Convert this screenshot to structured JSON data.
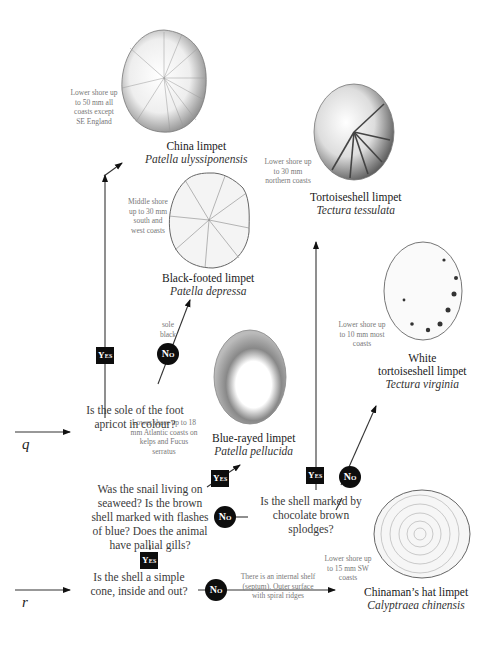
{
  "entry_points": {
    "q": "q",
    "r": "r"
  },
  "species": {
    "china": {
      "common": "China limpet",
      "latin": "Patella ulyssiponensis",
      "note": "Lower shore up to 50 mm all coasts except SE England"
    },
    "black_footed": {
      "common": "Black-footed limpet",
      "latin": "Patella depressa",
      "note": "Middle shore up to 30 mm south and west coasts"
    },
    "tortoiseshell": {
      "common": "Tortoiseshell limpet",
      "latin": "Tectura tessulata",
      "note": "Lower shore up to 30 mm northern coasts"
    },
    "white_tortoiseshell": {
      "common_line1": "White",
      "common_line2": "tortoiseshell limpet",
      "latin": "Tectura virginia",
      "note": "Lower shore up to 10 mm most coasts"
    },
    "blue_rayed": {
      "common": "Blue-rayed limpet",
      "latin": "Patella pellucida",
      "note": "Lower shore up to 18 mm Atlantic coasts on kelps and Fucus serratus"
    },
    "chinamans_hat": {
      "common": "Chinaman’s hat limpet",
      "latin": "Calyptraea chinensis",
      "note": "Lower shore up to 15 mm SW coasts"
    }
  },
  "questions": {
    "sole_apricot": "Is the sole of the foot apricot in colour?",
    "seaweed": "Was the snail living on seaweed? Is the brown shell marked with flashes of blue? Does the animal have pallial gills?",
    "chocolate": "Is the shell marked by chocolate brown splodges?",
    "simple_cone": "Is the shell a simple cone, inside and out?"
  },
  "branch_notes": {
    "sole_black": "sole black",
    "septum": "There is an internal shelf (septum). Outer surface with spiral ridges"
  },
  "labels": {
    "yes": "Yes",
    "no": "No"
  }
}
